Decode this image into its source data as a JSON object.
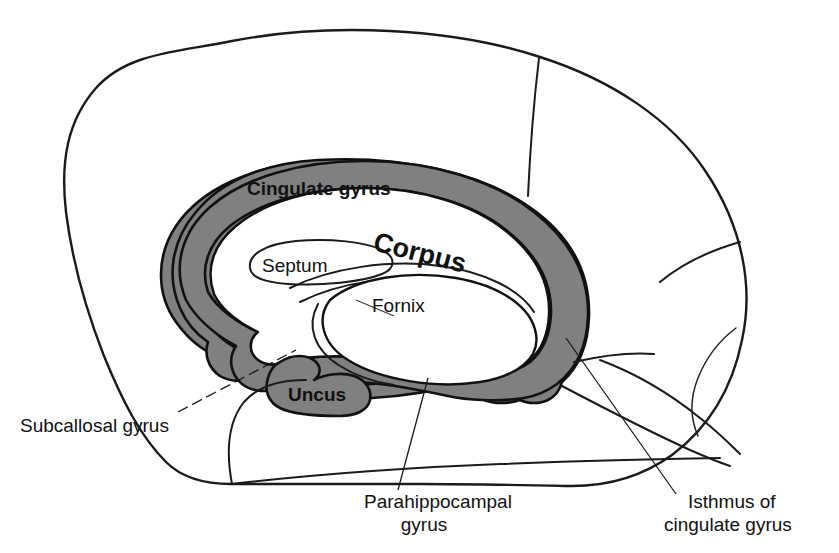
{
  "figure": {
    "background_color": "#ffffff",
    "outline_color": "#1a1a1a",
    "limbic_band_color": "#808080",
    "text_color": "#111111"
  },
  "labels": {
    "cingulate_gyrus": "Cingulate gyrus",
    "corpus": "Corpus",
    "septum": "Septum",
    "fornix": "Fornix",
    "uncus": "Uncus",
    "subcallosal_gyrus": "Subcallosal gyrus",
    "parahippocampal_gyrus_line1": "Parahippocampal",
    "parahippocampal_gyrus_line2": "gyrus",
    "isthmus_line1": "Isthmus of",
    "isthmus_line2": "cingulate gyrus"
  },
  "structures": [
    {
      "name": "cerebral-hemisphere-outline",
      "shaded": false
    },
    {
      "name": "cingulate-gyrus-band",
      "shaded": true
    },
    {
      "name": "parahippocampal-gyrus-band",
      "shaded": true
    },
    {
      "name": "uncus",
      "shaded": true
    },
    {
      "name": "isthmus-of-cingulate-gyrus",
      "shaded": true
    },
    {
      "name": "corpus-callosum",
      "shaded": false
    },
    {
      "name": "septum-pellucidum",
      "shaded": false
    },
    {
      "name": "fornix",
      "shaded": false
    },
    {
      "name": "brainstem-and-temporal-lobe",
      "shaded": false
    }
  ]
}
